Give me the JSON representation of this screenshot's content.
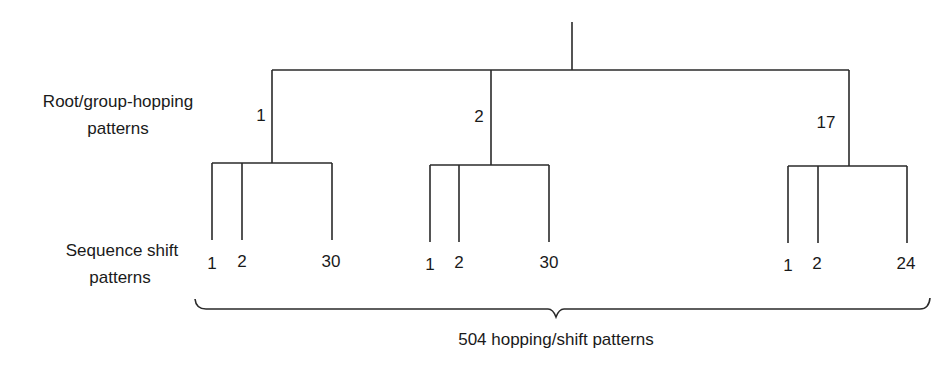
{
  "diagram": {
    "type": "tree",
    "side_labels": {
      "level1": [
        "Root/group-hopping",
        "patterns"
      ],
      "level2": [
        "Sequence shift",
        "patterns"
      ]
    },
    "groups": [
      {
        "label": "1",
        "leaves": [
          "1",
          "2",
          "30"
        ]
      },
      {
        "label": "2",
        "leaves": [
          "1",
          "2",
          "30"
        ]
      },
      {
        "label": "17",
        "leaves": [
          "1",
          "2",
          "24"
        ]
      }
    ],
    "total_label": "504 hopping/shift patterns",
    "line_color": "#2a2a2a",
    "text_color": "#1a1a1a"
  }
}
